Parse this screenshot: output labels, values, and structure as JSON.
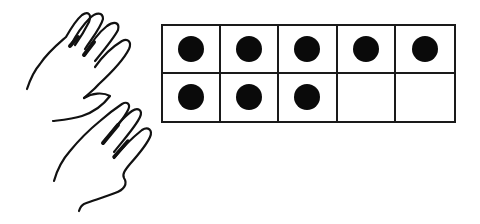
{
  "diagram": {
    "type": "ten-frame",
    "rows": 2,
    "columns": 5,
    "filled_count": 8,
    "cells": [
      {
        "row": 1,
        "col": 1,
        "filled": true
      },
      {
        "row": 1,
        "col": 2,
        "filled": true
      },
      {
        "row": 1,
        "col": 3,
        "filled": true
      },
      {
        "row": 1,
        "col": 4,
        "filled": true
      },
      {
        "row": 1,
        "col": 5,
        "filled": true
      },
      {
        "row": 2,
        "col": 1,
        "filled": true
      },
      {
        "row": 2,
        "col": 2,
        "filled": true
      },
      {
        "row": 2,
        "col": 3,
        "filled": true
      },
      {
        "row": 2,
        "col": 4,
        "filled": false
      },
      {
        "row": 2,
        "col": 5,
        "filled": false
      }
    ],
    "hands": [
      {
        "name": "upper-hand",
        "fingers_shown": 5
      },
      {
        "name": "lower-hand",
        "fingers_shown": 5
      }
    ],
    "colors": {
      "stroke": "#1a1a1a",
      "dot": "#0a0a0a",
      "background": "#ffffff"
    }
  }
}
